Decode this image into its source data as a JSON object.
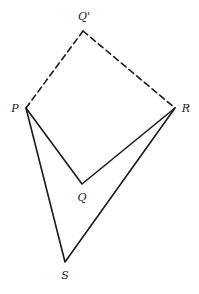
{
  "diagram": {
    "stroke_color": "#1a1a1a",
    "points": {
      "Qp": {
        "label": "Q'",
        "x": 83,
        "y": 31,
        "lx": 84,
        "ly": 20
      },
      "P": {
        "label": "P",
        "x": 26,
        "y": 108,
        "lx": 15,
        "ly": 112
      },
      "R": {
        "label": "R",
        "x": 175,
        "y": 108,
        "lx": 186,
        "ly": 112
      },
      "Q": {
        "label": "Q",
        "x": 82,
        "y": 184,
        "lx": 82,
        "ly": 201
      },
      "S": {
        "label": "S",
        "x": 65,
        "y": 262,
        "lx": 65,
        "ly": 279
      }
    },
    "edges": [
      {
        "from": "P",
        "to": "Qp",
        "style": "dashed"
      },
      {
        "from": "Qp",
        "to": "R",
        "style": "dashed"
      },
      {
        "from": "P",
        "to": "Q",
        "style": "solid"
      },
      {
        "from": "Q",
        "to": "R",
        "style": "solid"
      },
      {
        "from": "P",
        "to": "S",
        "style": "solid"
      },
      {
        "from": "S",
        "to": "R",
        "style": "solid"
      }
    ]
  }
}
